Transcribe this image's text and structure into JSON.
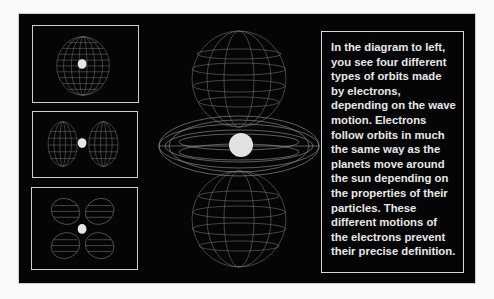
{
  "diagram": {
    "thumbnails": [
      {
        "label": "spherical orbital",
        "shape": "sphere"
      },
      {
        "label": "two-lobe orbital",
        "shape": "dumbbell"
      },
      {
        "label": "four-lobe orbital",
        "shape": "cloverleaf"
      }
    ],
    "main_figure": {
      "label": "torus with two lobes orbital",
      "shape": "dumbbell-with-torus"
    }
  },
  "description": {
    "text": "In the diagram to left, you see four different types of orbits made by electrons, depending on the wave motion. Electrons\nfollow orbits in much the same way as the planets move around the sun depending on the properties of their particles. These different motions of the electrons prevent their precise definition."
  },
  "colors": {
    "background": "#050505",
    "wireframe": "#8a8a8a",
    "nucleus": "#e6e6e6",
    "text": "#e8e8e8",
    "border": "#d0d0d0"
  }
}
